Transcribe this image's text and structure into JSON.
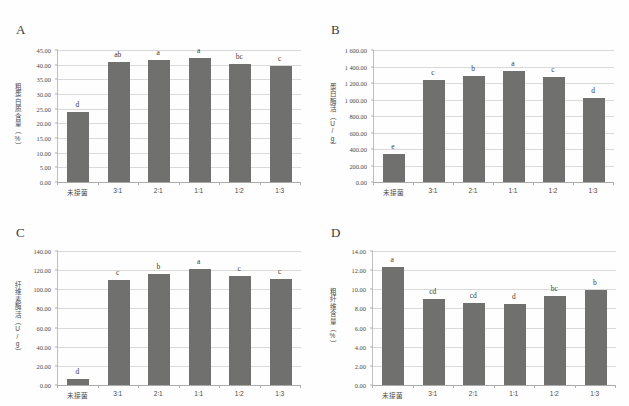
{
  "figure": {
    "background_color": "#fefefe",
    "bar_color": "#70706f",
    "grid_color": "#d9d9d9",
    "axis_color": "#aaaaaa"
  },
  "panels": [
    {
      "letter": "A",
      "ylabel": "粗蛋白质含量（%）",
      "categories": [
        "未接菌",
        "3∶1",
        "2∶1",
        "1∶1",
        "1∶2",
        "1∶3"
      ],
      "values": [
        23.8,
        40.9,
        41.7,
        42.3,
        40.1,
        39.4
      ],
      "sig_letters": [
        "d",
        "ab",
        "a",
        "a",
        "bc",
        "c"
      ],
      "yticks": [
        "0.00",
        "5.00",
        "10.00",
        "15.00",
        "20.00",
        "25.00",
        "30.00",
        "35.00",
        "40.00",
        "45.00"
      ],
      "ymin": 0,
      "ymax": 45,
      "ystep": 5
    },
    {
      "letter": "B",
      "ylabel": "蛋白酶活（U/g）",
      "categories": [
        "未接菌",
        "3∶1",
        "2∶1",
        "1∶1",
        "1∶2",
        "1∶3"
      ],
      "values": [
        340,
        1235,
        1290,
        1350,
        1270,
        1015
      ],
      "sig_letters": [
        "e",
        "c",
        "b",
        "a",
        "c",
        "d"
      ],
      "yticks": [
        "0.00",
        "200.00",
        "400.00",
        "600.00",
        "800.00",
        "1 000.00",
        "1 200.00",
        "1 400.00",
        "1 600.00"
      ],
      "ymin": 0,
      "ymax": 1600,
      "ystep": 200
    },
    {
      "letter": "C",
      "ylabel": "纤维素酶活（U/g）",
      "categories": [
        "未接菌",
        "3∶1",
        "2∶1",
        "1∶1",
        "1∶2",
        "1∶3"
      ],
      "values": [
        6.5,
        110.0,
        116.0,
        121.5,
        113.5,
        110.5
      ],
      "sig_letters": [
        "d",
        "c",
        "b",
        "a",
        "c",
        "c"
      ],
      "yticks": [
        "0.00",
        "20.00",
        "40.00",
        "60.00",
        "80.00",
        "100.00",
        "120.00",
        "140.00"
      ],
      "ymin": 0,
      "ymax": 140,
      "ystep": 20
    },
    {
      "letter": "D",
      "ylabel": "粗纤维含量（%）",
      "categories": [
        "未接菌",
        "3∶1",
        "2∶1",
        "1∶1",
        "1∶2",
        "1∶3"
      ],
      "values": [
        12.3,
        9.0,
        8.6,
        8.45,
        9.25,
        9.95
      ],
      "sig_letters": [
        "a",
        "cd",
        "cd",
        "d",
        "bc",
        "b"
      ],
      "yticks": [
        "0.00",
        "2.00",
        "4.00",
        "6.00",
        "8.00",
        "10.00",
        "12.00",
        "14.00"
      ],
      "ymin": 0,
      "ymax": 14,
      "ystep": 2
    }
  ],
  "chart_data": [
    {
      "type": "bar",
      "title": "A",
      "xlabel": "",
      "ylabel": "粗蛋白质含量（%）",
      "categories": [
        "未接菌",
        "3∶1",
        "2∶1",
        "1∶1",
        "1∶2",
        "1∶3"
      ],
      "values": [
        23.8,
        40.9,
        41.7,
        42.3,
        40.1,
        39.4
      ],
      "annotations": [
        "d",
        "ab",
        "a",
        "a",
        "bc",
        "c"
      ],
      "ylim": [
        0,
        45
      ],
      "ytick_step": 5,
      "grid": true,
      "legend": "none"
    },
    {
      "type": "bar",
      "title": "B",
      "xlabel": "",
      "ylabel": "蛋白酶活（U/g）",
      "categories": [
        "未接菌",
        "3∶1",
        "2∶1",
        "1∶1",
        "1∶2",
        "1∶3"
      ],
      "values": [
        340,
        1235,
        1290,
        1350,
        1270,
        1015
      ],
      "annotations": [
        "e",
        "c",
        "b",
        "a",
        "c",
        "d"
      ],
      "ylim": [
        0,
        1600
      ],
      "ytick_step": 200,
      "grid": true,
      "legend": "none"
    },
    {
      "type": "bar",
      "title": "C",
      "xlabel": "",
      "ylabel": "纤维素酶活（U/g）",
      "categories": [
        "未接菌",
        "3∶1",
        "2∶1",
        "1∶1",
        "1∶2",
        "1∶3"
      ],
      "values": [
        6.5,
        110.0,
        116.0,
        121.5,
        113.5,
        110.5
      ],
      "annotations": [
        "d",
        "c",
        "b",
        "a",
        "c",
        "c"
      ],
      "ylim": [
        0,
        140
      ],
      "ytick_step": 20,
      "grid": true,
      "legend": "none"
    },
    {
      "type": "bar",
      "title": "D",
      "xlabel": "",
      "ylabel": "粗纤维含量（%）",
      "categories": [
        "未接菌",
        "3∶1",
        "2∶1",
        "1∶1",
        "1∶2",
        "1∶3"
      ],
      "values": [
        12.3,
        9.0,
        8.6,
        8.45,
        9.25,
        9.95
      ],
      "annotations": [
        "a",
        "cd",
        "cd",
        "d",
        "bc",
        "b"
      ],
      "ylim": [
        0,
        14
      ],
      "ytick_step": 2,
      "grid": true,
      "legend": "none"
    }
  ]
}
